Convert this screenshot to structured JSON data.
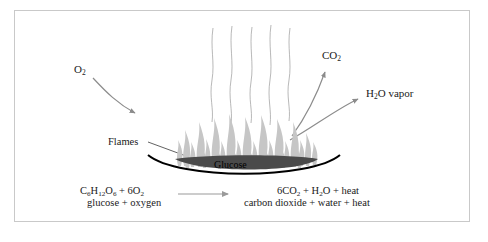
{
  "diagram": {
    "frame": {
      "border_color": "#c9c9c9",
      "background": "#ffffff"
    },
    "colors": {
      "flame": "#c6c6c6",
      "flame_core": "#e8e8e8",
      "dish_outline": "#000000",
      "glucose_fill": "#4a4a4a",
      "arrow": "#8c8c8c",
      "smoke": "#9a9a9a",
      "text": "#1a1a1a"
    },
    "labels": {
      "oxygen_in": "O2",
      "oxygen_in_display": "O",
      "oxygen_in_sub": "2",
      "carbon_dioxide_out": "CO",
      "carbon_dioxide_out_sub": "2",
      "water_vapor_prefix": "H",
      "water_vapor_sub": "2",
      "water_vapor_suffix": "O vapor",
      "flames": "Flames",
      "glucose": "Glucose"
    },
    "equation": {
      "reactants_formula_parts": [
        "C",
        "6",
        "H",
        "12",
        "O",
        "6",
        " + 6O",
        "2"
      ],
      "reactants_formula": "C6H12O6 + 6O2",
      "reactants_words": "glucose + oxygen",
      "products_formula": "6CO2 + H2O + heat",
      "products_words": "carbon dioxide + water + heat",
      "arrow_direction": "right"
    },
    "smoke_lines": 5,
    "flame_count": 26
  }
}
